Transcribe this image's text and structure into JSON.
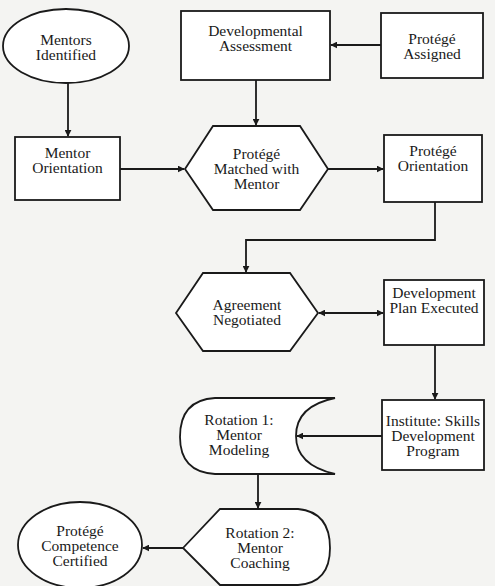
{
  "diagram": {
    "colors": {
      "background": "#f4f4f2",
      "stroke": "#1a1a1a",
      "fill": "#ffffff"
    },
    "nodes": {
      "mentors_identified": {
        "shape": "ellipse",
        "lines": [
          "Mentors",
          "Identified"
        ]
      },
      "developmental_assessment": {
        "shape": "rectangle",
        "lines": [
          "Developmental",
          "Assessment"
        ]
      },
      "protege_assigned": {
        "shape": "rectangle",
        "lines": [
          "Protégé",
          "Assigned"
        ]
      },
      "mentor_orientation": {
        "shape": "rectangle",
        "lines": [
          "Mentor",
          "Orientation"
        ]
      },
      "protege_matched": {
        "shape": "hexagon",
        "lines": [
          "Protégé",
          "Matched with",
          "Mentor"
        ]
      },
      "protege_orientation": {
        "shape": "rectangle",
        "lines": [
          "Protégé",
          "Orientation"
        ]
      },
      "agreement_negotiated": {
        "shape": "hexagon",
        "lines": [
          "Agreement",
          "Negotiated"
        ]
      },
      "development_plan_executed": {
        "shape": "rectangle",
        "lines": [
          "Development",
          "Plan Executed"
        ]
      },
      "rotation_1": {
        "shape": "stored-data",
        "lines": [
          "Rotation 1:",
          "Mentor",
          "Modeling"
        ]
      },
      "institute_program": {
        "shape": "rectangle",
        "lines": [
          "Institute: Skills",
          "Development",
          "Program"
        ]
      },
      "rotation_2": {
        "shape": "display",
        "lines": [
          "Rotation 2:",
          "Mentor",
          "Coaching"
        ]
      },
      "protege_certified": {
        "shape": "ellipse",
        "lines": [
          "Protégé",
          "Competence",
          "Certified"
        ]
      }
    },
    "edges": [
      {
        "from": "protege_assigned",
        "to": "developmental_assessment"
      },
      {
        "from": "mentors_identified",
        "to": "mentor_orientation"
      },
      {
        "from": "developmental_assessment",
        "to": "protege_matched"
      },
      {
        "from": "mentor_orientation",
        "to": "protege_matched"
      },
      {
        "from": "protege_matched",
        "to": "protege_orientation"
      },
      {
        "from": "protege_orientation",
        "to": "agreement_negotiated"
      },
      {
        "from": "agreement_negotiated",
        "to": "development_plan_executed",
        "bidirectional": true
      },
      {
        "from": "development_plan_executed",
        "to": "institute_program"
      },
      {
        "from": "institute_program",
        "to": "rotation_1"
      },
      {
        "from": "rotation_1",
        "to": "rotation_2"
      },
      {
        "from": "rotation_2",
        "to": "protege_certified"
      }
    ]
  }
}
